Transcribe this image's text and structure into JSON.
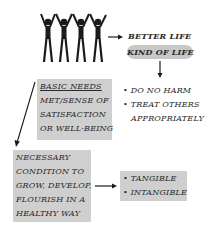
{
  "diagram": {
    "top": {
      "better_life": "BETTER LIFE",
      "kind_of_life": "KIND OF LIFE"
    },
    "basic_needs_box": {
      "heading": "BASIC NEEDS",
      "lines": [
        "MET/SENSE OF",
        "SATISFACTION",
        "OR WELL-BEING"
      ]
    },
    "principles": {
      "items": [
        "DO NO HARM",
        "TREAT OTHERS",
        "APPROPRIATELY"
      ],
      "bullet": "•"
    },
    "necessary_box": {
      "lines": [
        "NECESSARY",
        "CONDITION TO",
        "GROW, DEVELOP,",
        "FLOURISH IN A",
        "HEALTHY WAY"
      ]
    },
    "types_box": {
      "items": [
        "TANGIBLE",
        "INTANGIBLE"
      ],
      "bullet": "•"
    },
    "colors": {
      "box_fill": "#cfcfcf",
      "pill_fill": "#c8c8c8",
      "ink": "#1a1a1a"
    }
  }
}
